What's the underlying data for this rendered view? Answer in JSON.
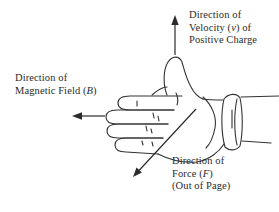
{
  "page": {
    "background_color": "#ffffff",
    "ink_color": "#2b2b2b",
    "line_color": "#333333"
  },
  "labels": {
    "velocity": {
      "line1": "Direction of",
      "line2_pre": "Velocity (",
      "line2_var": "v",
      "line2_post": ") of",
      "line3": "Positive Charge"
    },
    "magnetic_field": {
      "line1": "Direction of",
      "line2_pre": "Magnetic Field (",
      "line2_var": "B",
      "line2_post": ")"
    },
    "force": {
      "line1": "Direction of",
      "line2_pre": "Force (",
      "line2_var": "F",
      "line2_post": ")",
      "line3": "(Out of Page)"
    }
  },
  "icons": {
    "velocity_arrow": "up-arrow",
    "magnetic_field_arrow": "left-arrow",
    "force_arrow": "down-left-arrow",
    "hand": "right-hand-thumb-up-fingers-left"
  }
}
